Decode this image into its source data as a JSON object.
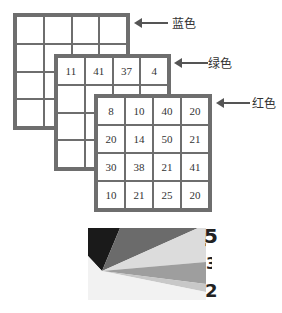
{
  "layers": [
    {
      "name": "blue",
      "label": "蓝色",
      "values": [
        [
          "",
          "",
          "",
          ""
        ],
        [
          "",
          "",
          "",
          ""
        ],
        [
          "",
          "",
          "",
          ""
        ],
        [
          "",
          "",
          "",
          ""
        ]
      ]
    },
    {
      "name": "green",
      "label": "绿色",
      "values": [
        [
          "11",
          "41",
          "37",
          "4"
        ],
        [
          "",
          "",
          "",
          ""
        ],
        [
          "",
          "",
          "",
          ""
        ],
        [
          "",
          "",
          "",
          ""
        ]
      ]
    },
    {
      "name": "red",
      "label": "红色",
      "values": [
        [
          "8",
          "10",
          "40",
          "20"
        ],
        [
          "20",
          "14",
          "50",
          "21"
        ],
        [
          "30",
          "38",
          "21",
          "41"
        ],
        [
          "10",
          "21",
          "25",
          "20"
        ]
      ]
    }
  ],
  "pie_fragment": {
    "labels": [
      "5",
      "3",
      "2"
    ],
    "colors": [
      "#1a1a1a",
      "#6b6b6b",
      "#d9d9d9",
      "#9e9e9e",
      "#c8c8c8",
      "#f2f2f2"
    ]
  }
}
